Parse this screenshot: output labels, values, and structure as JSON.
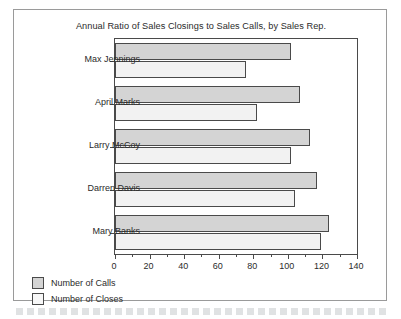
{
  "figure": {
    "title": "Annual Ratio of Sales Closings to Sales Calls, by Sales Rep."
  },
  "legend": {
    "items": [
      {
        "label": "Number of Calls",
        "swatch": "gray"
      },
      {
        "label": "Number of Closes",
        "swatch": "white"
      }
    ]
  },
  "axis": {
    "x_ticks": [
      "0",
      "20",
      "40",
      "60",
      "80",
      "100",
      "120",
      "140"
    ]
  },
  "colors": {
    "calls_fill": "#d4d4d4",
    "closes_fill": "#f2f2f2",
    "bar_outline": "#4a4a4a",
    "axis": "#4a4a4a",
    "frame": "#9a9a9a",
    "text": "#2b2b2b"
  },
  "chart_data": {
    "type": "bar",
    "orientation": "horizontal",
    "title": "Annual Ratio of Sales Closings to Sales Calls, by Sales Rep.",
    "xlabel": "",
    "ylabel": "",
    "xlim": [
      0,
      140
    ],
    "x_major_ticks": [
      0,
      20,
      40,
      60,
      80,
      100,
      120,
      140
    ],
    "x_minor_tick_interval": 10,
    "grid": false,
    "legend_position": "below-left",
    "categories": [
      "Max Jennings",
      "April Marks",
      "Larry McCoy",
      "Darren Davis",
      "Mary Banks"
    ],
    "series": [
      {
        "name": "Number of Calls",
        "values": [
          102,
          107,
          113,
          117,
          124
        ]
      },
      {
        "name": "Number of Closes",
        "values": [
          76,
          82,
          102,
          104,
          119
        ]
      }
    ]
  }
}
